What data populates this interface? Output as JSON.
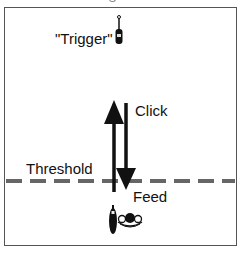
{
  "diagram": {
    "labels": {
      "trigger": "\"Trigger\"",
      "click": "Click",
      "threshold": "Threshold",
      "feed": "Feed"
    },
    "icons": {
      "trigger_device": "handheld-remote-icon",
      "feeder_device": "handheld-remote-icon",
      "animal": "fish-or-creature-icon"
    },
    "arrows": [
      {
        "name": "up-arrow",
        "direction": "up",
        "meaning": "Click"
      },
      {
        "name": "down-arrow",
        "direction": "down",
        "meaning": "Feed"
      }
    ],
    "threshold_line": {
      "style": "dashed",
      "color": "#666666"
    },
    "colors": {
      "ink": "#111111",
      "frame": "#555555",
      "dash": "#666666"
    }
  }
}
